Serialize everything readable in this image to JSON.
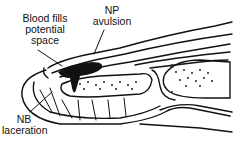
{
  "diagram": {
    "labels": {
      "blood": [
        "Blood fills",
        "potential",
        "space"
      ],
      "np": [
        "NP",
        "avulsion"
      ],
      "nb": [
        "NB",
        "laceration"
      ]
    },
    "colors": {
      "ink": "#111111",
      "background": "#ffffff"
    }
  }
}
